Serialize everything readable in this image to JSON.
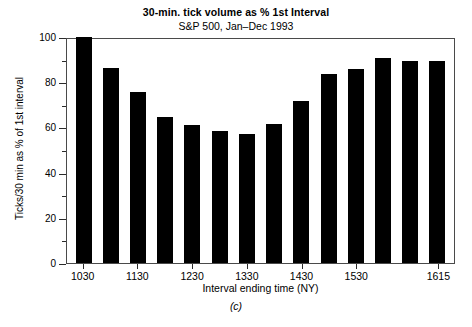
{
  "chart_data": {
    "type": "bar",
    "title": "30-min. tick volume as % 1st Interval",
    "subtitle": "S&P 500, Jan–Dec 1993",
    "xlabel": "Interval ending time (NY)",
    "ylabel": "Ticks/30 min as % of 1st interval",
    "caption": "(c)",
    "categories": [
      "1030",
      "1100",
      "1130",
      "1200",
      "1230",
      "1300",
      "1330",
      "1400",
      "1430",
      "1500",
      "1530",
      "1600",
      "1615",
      "1615b"
    ],
    "values": [
      100,
      86.5,
      75.5,
      64.5,
      61,
      58.5,
      57,
      61.5,
      71.5,
      83.5,
      86,
      90.5,
      89.5,
      89.5
    ],
    "ylim": [
      0,
      100
    ],
    "yticks_major": [
      0,
      20,
      40,
      60,
      80,
      100
    ],
    "yticks_minor": [
      10,
      30,
      50,
      70,
      90
    ],
    "ytick_labels": [
      "0",
      "20",
      "40",
      "60",
      "80",
      "100"
    ],
    "xtick_labels": [
      "1030",
      "1130",
      "1230",
      "1330",
      "1430",
      "1530",
      "1615"
    ],
    "xtick_bar_index": [
      0,
      2,
      4,
      6,
      8,
      10,
      13
    ],
    "grid": false,
    "legend": false,
    "bar_color": "#000000",
    "axis_color": "#2b2b2b",
    "background": "#ffffff"
  }
}
